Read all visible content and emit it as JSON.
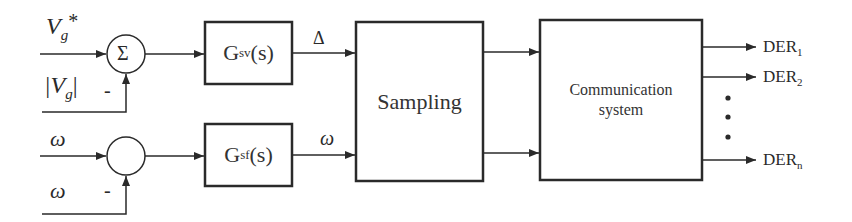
{
  "figure": {
    "type": "block-diagram",
    "colors": {
      "stroke": "#2a2a2a",
      "background": "#ffffff"
    }
  },
  "inputs": {
    "vg_ref": {
      "base": "V",
      "sub": "g",
      "sup": "*"
    },
    "vg_meas": {
      "base": "|V",
      "sub": "g",
      "close": "|"
    },
    "omega_ref": "ω",
    "omega_meas": "ω",
    "minus_sign_top": "-",
    "minus_sign_bottom": "-"
  },
  "junctions": {
    "top": {
      "symbol": "Σ"
    },
    "bottom": {
      "symbol": ""
    }
  },
  "blocks": {
    "gsv": {
      "base": "G",
      "sub": "sv",
      "tail": "(s)"
    },
    "gsf": {
      "base": "G",
      "sub": "sf",
      "tail": "(s)"
    },
    "sampling": {
      "label": "Sampling"
    },
    "comm": {
      "line1": "Communication",
      "line2": "system"
    }
  },
  "signals": {
    "delta": "Δ",
    "omega_out": "ω"
  },
  "outputs": [
    {
      "base": "DER",
      "sub": "1"
    },
    {
      "base": "DER",
      "sub": "2"
    },
    {
      "base": "DER",
      "sub": "n"
    }
  ],
  "ellipsis": "⋮"
}
